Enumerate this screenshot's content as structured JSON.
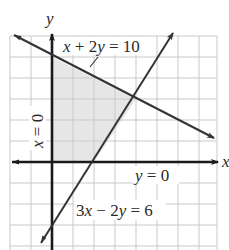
{
  "figure": {
    "type": "system-of-inequalities-graph",
    "axes": {
      "x_label": "x",
      "y_label": "y",
      "origin_px": [
        52,
        162
      ],
      "unit_px": 21,
      "x_range": [
        -2,
        8
      ],
      "y_range": [
        -4,
        6
      ],
      "grid": true
    },
    "lines": [
      {
        "id": "line1",
        "equation": "x + 2y = 10",
        "label_parts": [
          "x",
          " + 2",
          "y",
          " = 10"
        ],
        "intercepts": {
          "x": 10,
          "y": 5
        }
      },
      {
        "id": "line2",
        "equation": "3x − 2y = 6",
        "label_parts": [
          "3",
          "x",
          " − 2",
          "y",
          " = 6"
        ],
        "intercepts": {
          "x": 2,
          "y": -3
        }
      },
      {
        "id": "line3",
        "equation": "y = 0",
        "label_parts": [
          "y",
          " = 0"
        ]
      },
      {
        "id": "line4",
        "equation": "x = 0",
        "label_parts": [
          "x",
          " = 0"
        ]
      }
    ],
    "feasible_region": {
      "vertices": [
        [
          0,
          0
        ],
        [
          2,
          0
        ],
        [
          4,
          3
        ],
        [
          0,
          5
        ]
      ],
      "fill": "#e6e6e6"
    },
    "colors": {
      "grid": "#c9c9c9",
      "axis": "#1a1a1a",
      "line": "#333333",
      "shade": "#e6e6e6",
      "text": "#2a2a2a"
    }
  }
}
